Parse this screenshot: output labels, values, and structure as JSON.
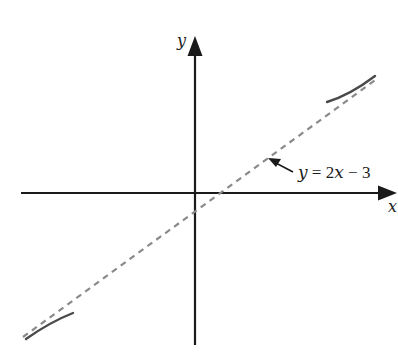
{
  "diagram": {
    "title": "",
    "axes": {
      "x_label": "x",
      "y_label": "y"
    },
    "asymptote": {
      "label_y": "y",
      "label_eq": " = 2",
      "label_x": "x",
      "label_rest": " − 3",
      "full_label": "y = 2x − 3",
      "style": "dashed"
    },
    "curve_branches": [
      {
        "name": "upper-right-branch",
        "description": "curve approaching asymptote from above, upper right"
      },
      {
        "name": "lower-left-branch",
        "description": "curve approaching asymptote from below, lower left"
      }
    ],
    "colors": {
      "axis": "#1a1a1a",
      "asymptote": "#8a8a8a",
      "curve": "#4a4a4a",
      "text": "#1e1e1e",
      "background": "#ffffff"
    }
  }
}
